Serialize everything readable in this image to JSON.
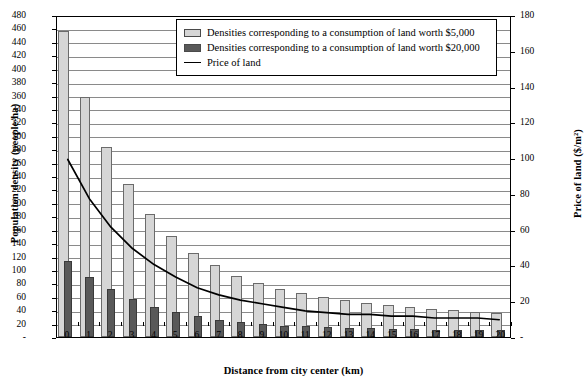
{
  "chart_data": {
    "type": "bar",
    "title": "",
    "xlabel": "Distance from city center (km)",
    "ylabel": "Population density (people/ha)",
    "y2label": "Price of land ($/m²)",
    "grid": true,
    "legend_position": "top-center",
    "categories": [
      0,
      1,
      2,
      3,
      4,
      5,
      6,
      7,
      8,
      9,
      10,
      11,
      12,
      13,
      14,
      15,
      16,
      17,
      18,
      19,
      20
    ],
    "xtick_labels": [
      "0",
      "1",
      "2",
      "3",
      "4",
      "5",
      "6",
      "7",
      "8",
      "9",
      "10",
      "11",
      "12",
      "13",
      "14",
      "15",
      "16",
      "17",
      "18",
      "19",
      "20"
    ],
    "ylim": [
      0,
      480
    ],
    "ytick_step": 20,
    "ytick_labels": [
      "-",
      "20",
      "40",
      "60",
      "80",
      "100",
      "120",
      "140",
      "160",
      "180",
      "200",
      "220",
      "240",
      "260",
      "280",
      "300",
      "320",
      "340",
      "360",
      "380",
      "400",
      "420",
      "440",
      "460",
      "480"
    ],
    "y2lim": [
      0,
      180
    ],
    "y2tick_step": 20,
    "y2tick_labels": [
      "-",
      "20",
      "40",
      "60",
      "80",
      "100",
      "120",
      "140",
      "160",
      "180"
    ],
    "series": [
      {
        "name": "Densities corresponding to a consumption of land worth $5,000",
        "type": "bar",
        "axis": "left",
        "color": "#d6d6d6",
        "values": [
          456,
          358,
          283,
          228,
          184,
          150,
          125,
          107,
          91,
          80,
          72,
          65,
          59,
          55,
          51,
          47,
          44,
          42,
          40,
          38,
          36
        ]
      },
      {
        "name": "Densities corresponding to a consumption of land worth $20,000",
        "type": "bar",
        "axis": "left",
        "color": "#595959",
        "values": [
          114,
          90,
          71,
          57,
          45,
          38,
          31,
          26,
          23,
          19,
          17,
          16,
          15,
          14,
          13,
          12,
          12,
          11,
          11,
          10,
          10
        ]
      },
      {
        "name": "Price of land",
        "type": "line",
        "axis": "right",
        "color": "#000000",
        "values": [
          100,
          78,
          62,
          50,
          41,
          34,
          28,
          24,
          21,
          19,
          17,
          15,
          14,
          13,
          13,
          12,
          12,
          11,
          11,
          11,
          10
        ]
      }
    ]
  },
  "legend": {
    "items": [
      {
        "label": "Densities corresponding to a consumption of land worth $5,000",
        "swatch": "light"
      },
      {
        "label": "Densities corresponding to a consumption of land worth $20,000",
        "swatch": "dark"
      },
      {
        "label": "Price of land",
        "swatch": "line"
      }
    ]
  },
  "colors": {
    "bar_light": "#d6d6d6",
    "bar_dark": "#595959",
    "line": "#000000",
    "grid": "#8a8a8a",
    "frame": "#000000"
  }
}
